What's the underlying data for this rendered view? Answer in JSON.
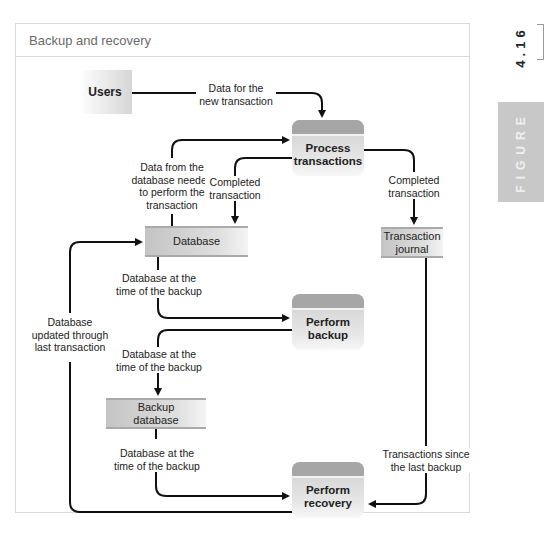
{
  "figure": {
    "title": "Backup and recovery",
    "number": "4.16",
    "label": "FIGURE"
  },
  "nodes": {
    "users": {
      "type": "external-entity",
      "label": "Users"
    },
    "process_transactions": {
      "type": "process",
      "label": "Process transactions"
    },
    "database": {
      "type": "data-store",
      "label": "Database"
    },
    "transaction_journal": {
      "type": "data-store",
      "label": "Transaction journal"
    },
    "perform_backup": {
      "type": "process",
      "label": "Perform backup"
    },
    "backup_database": {
      "type": "data-store",
      "label": "Backup database"
    },
    "perform_recovery": {
      "type": "process",
      "label": "Perform recovery"
    }
  },
  "flows": [
    {
      "from": "users",
      "to": "process_transactions",
      "label": "Data for the new transaction"
    },
    {
      "from": "database",
      "to": "process_transactions",
      "label": "Data from the database needed to perform the transaction"
    },
    {
      "from": "process_transactions",
      "to": "database",
      "label": "Completed transaction"
    },
    {
      "from": "process_transactions",
      "to": "transaction_journal",
      "label": "Completed transaction"
    },
    {
      "from": "database",
      "to": "perform_backup",
      "label": "Database at the time of the backup"
    },
    {
      "from": "perform_backup",
      "to": "backup_database",
      "label": "Database at the time of the backup"
    },
    {
      "from": "backup_database",
      "to": "perform_recovery",
      "label": "Database at the time of the backup"
    },
    {
      "from": "transaction_journal",
      "to": "perform_recovery",
      "label": "Transactions since the last backup"
    },
    {
      "from": "perform_recovery",
      "to": "database",
      "label": "Database updated through last transaction"
    }
  ],
  "labels": {
    "users_to_pt_1": "Data for the",
    "users_to_pt_2": "new transaction",
    "db_to_pt_1": "Data from the",
    "db_to_pt_2": "database needed",
    "db_to_pt_3": "to perform the",
    "db_to_pt_4": "transaction",
    "pt_to_db_1": "Completed",
    "pt_to_db_2": "transaction",
    "pt_to_tj_1": "Completed",
    "pt_to_tj_2": "transaction",
    "db_to_pb_1": "Database at the",
    "db_to_pb_2": "time of the backup",
    "pb_to_bdb_1": "Database at the",
    "pb_to_bdb_2": "time of the backup",
    "bdb_to_pr_1": "Database at the",
    "bdb_to_pr_2": "time of the backup",
    "tj_to_pr_1": "Transactions since",
    "tj_to_pr_2": "the last backup",
    "pr_to_db_1": "Database",
    "pr_to_db_2": "updated through",
    "pr_to_db_3": "last transaction"
  },
  "process_lines": {
    "pt_1": "Process",
    "pt_2": "transactions",
    "pb_1": "Perform",
    "pb_2": "backup",
    "pr_1": "Perform",
    "pr_2": "recovery",
    "tj_1": "Transaction",
    "tj_2": "journal",
    "bdb_1": "Backup",
    "bdb_2": "database"
  }
}
